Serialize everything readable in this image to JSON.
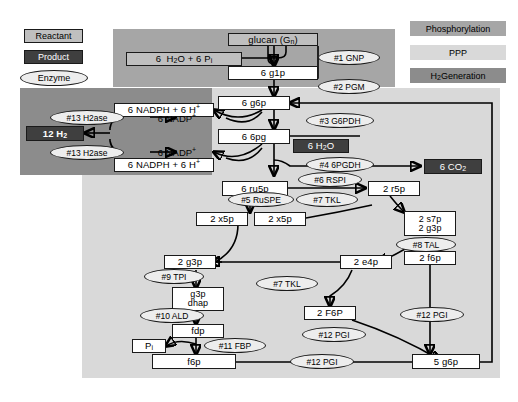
{
  "legend": {
    "left": [
      {
        "key": "reactant",
        "label": "Reactant"
      },
      {
        "key": "product",
        "label": "Product"
      },
      {
        "key": "enzyme",
        "label": "Enzyme"
      }
    ],
    "right": [
      {
        "key": "phosphorylation",
        "label": "Phosphorylation",
        "color": "#a6a6a6"
      },
      {
        "key": "ppp",
        "label": "PPP",
        "color": "#d9d9d9"
      },
      {
        "key": "h2",
        "label": "H2 Generation",
        "label_html": "H<sub>2</sub> Generation",
        "color": "#8c8c8c"
      }
    ]
  },
  "regions": {
    "phosphorylation": {
      "label": "Phosphorylation",
      "color": "#a6a6a6"
    },
    "ppp": {
      "label": "PPP",
      "color": "#d9d9d9"
    },
    "h2_generation": {
      "label": "H2 Generation",
      "color": "#8c8c8c"
    }
  },
  "nodes": {
    "glucan": {
      "label": "glucan (Gn)",
      "html": "glucan (G<sub>n</sub>)",
      "type": "reactant"
    },
    "water_pi": {
      "label": "6 H2O + 6 Pi",
      "html": "6 &nbsp;H<sub>2</sub>O + 6 P<sub>i</sub>",
      "type": "reactant"
    },
    "g1p": {
      "label": "6 g1p",
      "html": "6 g1p",
      "type": "plain"
    },
    "g6p_top": {
      "label": "6 g6p",
      "html": "6 g6p",
      "type": "plain"
    },
    "sixpg": {
      "label": "6 6pg",
      "html": "6 6pg",
      "type": "plain"
    },
    "water_mid": {
      "label": "6 H2O",
      "html": "6 H<sub>2</sub>O",
      "type": "product"
    },
    "nadph_top": {
      "label": "6 NADPH + 6 H+",
      "html": "6 NADPH + 6 H<sup>+</sup>",
      "type": "plain"
    },
    "nadp_top": {
      "label": "6 NADP+",
      "html": "6 NADP<sup>+</sup>",
      "type": "none"
    },
    "nadp_bot": {
      "label": "6 NADP+",
      "html": "6 NADP<sup>+</sup>",
      "type": "none"
    },
    "nadph_bot": {
      "label": "6 NADPH + 6 H+",
      "html": "6 NADPH + 6 H<sup>+</sup>",
      "type": "plain"
    },
    "h2": {
      "label": "12 H2",
      "html": "12 H<sub>2</sub>",
      "type": "product"
    },
    "co2": {
      "label": "6 CO2",
      "html": "6 CO<sub>2</sub>",
      "type": "product"
    },
    "ru5p": {
      "label": "6 ru5p",
      "html": "6 ru5p",
      "type": "plain"
    },
    "r5p": {
      "label": "2 r5p",
      "html": "2 r5p",
      "type": "plain"
    },
    "x5p_a": {
      "label": "2 x5p",
      "html": "2 x5p",
      "type": "plain"
    },
    "x5p_b": {
      "label": "2 x5p",
      "html": "2 x5p",
      "type": "plain"
    },
    "s7p_g3p": {
      "line1": "2 s7p",
      "line2": "2 g3p",
      "type": "plain"
    },
    "e4p": {
      "label": "2 e4p",
      "html": "2 e4p",
      "type": "plain"
    },
    "g3p_left": {
      "label": "2 g3p",
      "html": "2 g3p",
      "type": "plain"
    },
    "f6p_right": {
      "label": "2 f6p",
      "html": "2 f6p",
      "type": "plain"
    },
    "g3p_dhap": {
      "line1": "g3p",
      "line2": "dhap",
      "type": "plain"
    },
    "f6p_mid": {
      "label": "2 F6P",
      "html": "2 F6P",
      "type": "plain"
    },
    "fdp": {
      "label": "fdp",
      "html": "fdp",
      "type": "plain"
    },
    "pi": {
      "label": "Pi",
      "html": "P<sub>i</sub>",
      "type": "plain"
    },
    "f6p_bottom": {
      "label": "f6p",
      "html": "f6p",
      "type": "plain"
    },
    "g6p_bottom": {
      "label": "5 g6p",
      "html": "5 g6p",
      "type": "plain"
    }
  },
  "enzymes": {
    "gnp": {
      "label": "#1 GNP"
    },
    "pgm": {
      "label": "#2 PGM"
    },
    "g6pdh": {
      "label": "#3 G6PDH"
    },
    "sixpgdh": {
      "label": "#4 6PGDH"
    },
    "ru5pe": {
      "label": "#5 RuSPE"
    },
    "rspi": {
      "label": "#6 RSPI"
    },
    "tkl_top": {
      "label": "#7 TKL"
    },
    "tal": {
      "label": "#8 TAL"
    },
    "tpi": {
      "label": "#9 TPI"
    },
    "ald": {
      "label": "#10 ALD"
    },
    "fbp": {
      "label": "#11 FBP"
    },
    "tkl_bottom": {
      "label": "#7 TKL"
    },
    "pgi_right": {
      "label": "#12 PGI"
    },
    "pgi_mid": {
      "label": "#12 PGI"
    },
    "pgi_bottom": {
      "label": "#12 PGI"
    },
    "h2ase_top": {
      "label": "#13 H2ase"
    },
    "h2ase_bottom": {
      "label": "#13 H2ase"
    }
  }
}
